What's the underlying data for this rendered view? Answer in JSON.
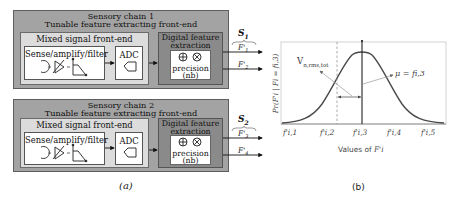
{
  "figure_a": {
    "caption": "(a)",
    "chains": [
      {
        "title_line1": "Sensory chain 1",
        "title_line2": "Tunable feature extracting front-end",
        "mixed_signal_label": "Mixed signal front-end",
        "sense_label": "Sense/amplify/filter",
        "adc_label": "ADC",
        "digital_label_line1": "Digital feature",
        "digital_label_line2": "extraction",
        "precision_label": "precision",
        "nb_label": "(nb)",
        "signal_group": "S",
        "signal_group_sub": "1",
        "outputs": [
          "F'",
          "F'"
        ],
        "output_subs": [
          "1",
          "2"
        ]
      },
      {
        "title_line1": "Sensory chain 2",
        "title_line2": "Tunable feature extracting front-end",
        "mixed_signal_label": "Mixed signal front-end",
        "sense_label": "Sense/amplify/filter",
        "adc_label": "ADC",
        "digital_label_line1": "Digital feature",
        "digital_label_line2": "extraction",
        "precision_label": "precision",
        "nb_label": "(nb)",
        "signal_group": "S",
        "signal_group_sub": "2",
        "outputs": [
          "F'",
          "F'"
        ],
        "output_subs": [
          "3",
          "4"
        ]
      }
    ],
    "icons": [
      "sensor-coil-icon",
      "amplifier-icon",
      "lowpass-filter-icon",
      "adc-icon",
      "adder-icon",
      "multiplier-icon"
    ]
  },
  "figure_b": {
    "caption": "(b)",
    "ylabel": "Pr(F'i | Fi = fi,3)",
    "xlabel_prefix": "Values of ",
    "xlabel_var": "F'i",
    "annotation_noise": "Vn,rms,tot",
    "annotation_noise_main": "V",
    "annotation_noise_sub": "n,rms,tot",
    "annotation_mean": "μ = fi,3",
    "xticks": [
      "f'i,1",
      "f'i,2",
      "f'i,3",
      "f'i,4",
      "f'i,5"
    ],
    "colors": {
      "curve": "#4a4a4a",
      "axis": "#bdbdbd",
      "mean_line": "#222222"
    }
  }
}
